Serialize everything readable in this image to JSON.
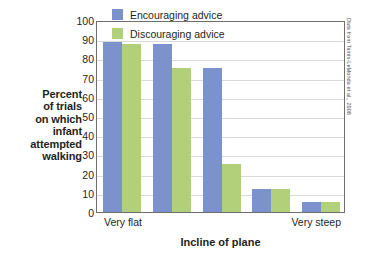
{
  "chart_data": {
    "type": "bar",
    "title": "",
    "subtitle": "",
    "xlabel": "Incline of plane",
    "ylabel": "Percent of trials on which infant attempted walking",
    "ylabel_lines": [
      "Percent",
      "of trials",
      "on which",
      "infant",
      "attempted",
      "walking"
    ],
    "categories": [
      "Very flat",
      "",
      "",
      "",
      "Very steep"
    ],
    "x_tick_labels": {
      "left": "Very flat",
      "right": "Very steep"
    },
    "series": [
      {
        "name": "Encouraging advice",
        "color": "#7b92cd",
        "values": [
          88.5,
          87.5,
          75,
          12,
          5
        ]
      },
      {
        "name": "Discouraging advice",
        "color": "#b2cf7a",
        "values": [
          87.5,
          75,
          25,
          12,
          5
        ]
      }
    ],
    "ylim": [
      0,
      100
    ],
    "y_ticks": [
      0,
      10,
      20,
      30,
      40,
      50,
      60,
      70,
      80,
      90,
      100
    ],
    "grid": true,
    "legend_position": "top-right-inside",
    "annotations": [
      "Data from Tamis-LeMonda et al., 2008"
    ]
  },
  "legend": {
    "items": [
      {
        "label": "Encouraging advice",
        "color": "#7b92cd"
      },
      {
        "label": "Discouraging advice",
        "color": "#b2cf7a"
      }
    ]
  },
  "source": {
    "attribution": "Data from Tamis-LeMonda et al., 2008"
  }
}
